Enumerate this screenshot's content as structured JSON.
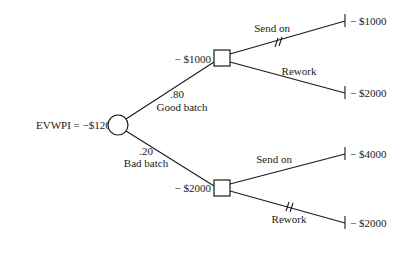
{
  "diagram": {
    "type": "decision-tree",
    "root": {
      "label": "EVWPI = −$1200",
      "shape": "chance-circle"
    },
    "branches": [
      {
        "probability": ".80",
        "label": "Good batch",
        "decision_node": {
          "value": "− $1000",
          "shape": "decision-square"
        },
        "options": [
          {
            "label": "Send on",
            "payoff": "− $1000",
            "pruned": true
          },
          {
            "label": "Rework",
            "payoff": "− $2000",
            "pruned": false
          }
        ]
      },
      {
        "probability": ".20",
        "label": "Bad batch",
        "decision_node": {
          "value": "− $2000",
          "shape": "decision-square"
        },
        "options": [
          {
            "label": "Send on",
            "payoff": "− $4000",
            "pruned": false
          },
          {
            "label": "Rework",
            "payoff": "− $2000",
            "pruned": true
          }
        ]
      }
    ]
  }
}
